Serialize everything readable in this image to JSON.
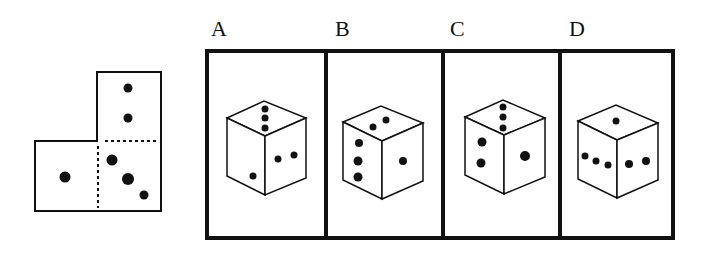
{
  "puzzle": {
    "type": "cube-net-folding",
    "net": {
      "faces": [
        {
          "position": "top",
          "pips": 2
        },
        {
          "position": "left",
          "pips": 1
        },
        {
          "position": "center",
          "pips": 3
        }
      ]
    },
    "options": [
      {
        "label": "A",
        "top": 3,
        "left": 1,
        "right": 2
      },
      {
        "label": "B",
        "top": 2,
        "left": 3,
        "right": 1
      },
      {
        "label": "C",
        "top": 3,
        "left": 2,
        "right": 1
      },
      {
        "label": "D",
        "top": 1,
        "left": 3,
        "right": 2
      }
    ],
    "colors": {
      "line": "#111111",
      "background": "#ffffff"
    }
  }
}
